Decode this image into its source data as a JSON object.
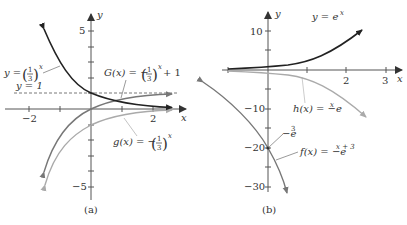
{
  "figure": {
    "panel_a": {
      "caption": "(a)",
      "axis_x_label": "x",
      "axis_y_label": "y",
      "x_ticks": [
        {
          "value": -2,
          "label": "−2"
        },
        {
          "value": -1,
          "label": ""
        },
        {
          "value": 1,
          "label": ""
        },
        {
          "value": 2,
          "label": "2"
        }
      ],
      "y_ticks": [
        {
          "value": 5,
          "label": "5"
        },
        {
          "value": 4,
          "label": ""
        },
        {
          "value": 3,
          "label": ""
        },
        {
          "value": 2,
          "label": ""
        },
        {
          "value": 1,
          "label": ""
        },
        {
          "value": -1,
          "label": ""
        },
        {
          "value": -2,
          "label": ""
        },
        {
          "value": -3,
          "label": ""
        },
        {
          "value": -4,
          "label": ""
        },
        {
          "value": -5,
          "label": "−5"
        }
      ],
      "asymptote_label": "y = 1",
      "curves": [
        {
          "name": "y = (1/3)^x",
          "label_lhs": "y =",
          "base": "1/3",
          "exp": "x",
          "color": "#222222"
        },
        {
          "name": "G(x) = -(1/3)^x + 1",
          "label_lhs": "G(x) = −",
          "base": "1/3",
          "exp": "x",
          "tail": "+ 1",
          "color": "#777777"
        },
        {
          "name": "g(x) = -(1/3)^x",
          "label_lhs": "g(x) = −",
          "base": "1/3",
          "exp": "x",
          "color": "#aaaaaa"
        }
      ]
    },
    "panel_b": {
      "caption": "(b)",
      "axis_x_label": "x",
      "axis_y_label": "y",
      "x_ticks": [
        {
          "value": -1,
          "label": ""
        },
        {
          "value": 1,
          "label": ""
        },
        {
          "value": 2,
          "label": "2"
        },
        {
          "value": 3,
          "label": "3"
        }
      ],
      "y_ticks": [
        {
          "value": 10,
          "label": "10"
        },
        {
          "value": 5,
          "label": ""
        },
        {
          "value": -5,
          "label": ""
        },
        {
          "value": -10,
          "label": "−10"
        },
        {
          "value": -15,
          "label": ""
        },
        {
          "value": -20,
          "label": "−20"
        },
        {
          "value": -25,
          "label": ""
        },
        {
          "value": -30,
          "label": "−30"
        }
      ],
      "point_label": "−e",
      "point_label_exp": "3",
      "curves": [
        {
          "name": "y = e^x",
          "label": "y = e",
          "exp": "x",
          "color": "#222222"
        },
        {
          "name": "h(x) = -e^x",
          "label": "h(x) = −e",
          "exp": "x",
          "color": "#aaaaaa"
        },
        {
          "name": "f(x) = -e^(x+3)",
          "label": "f(x) = −e",
          "exp": "x + 3",
          "color": "#777777"
        }
      ]
    }
  }
}
